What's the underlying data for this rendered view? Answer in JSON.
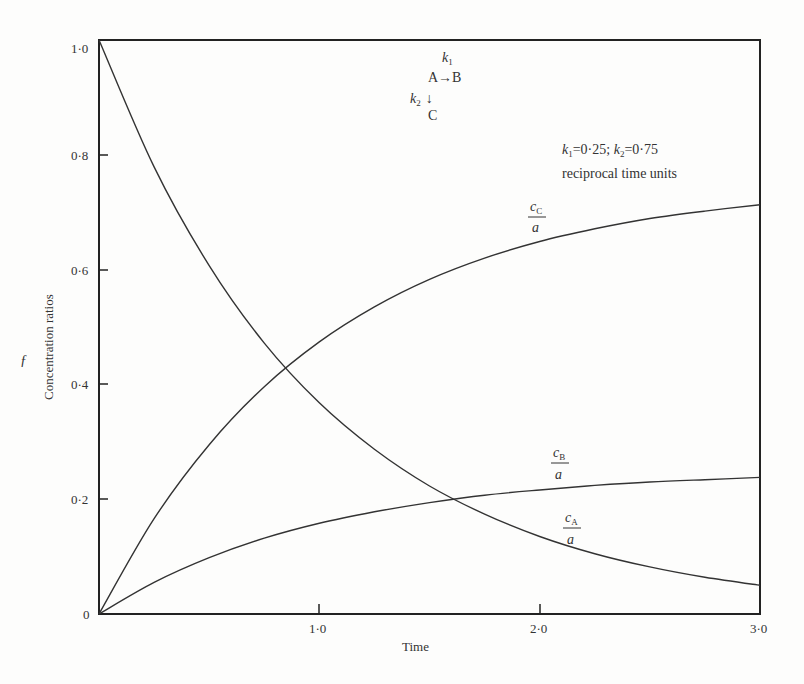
{
  "chart_data": {
    "type": "line",
    "title": "",
    "xlabel": "Time",
    "ylabel": "Concentration ratios",
    "xlim": [
      0,
      3.0
    ],
    "ylim": [
      0,
      1.0
    ],
    "x_ticks": [
      "1·0",
      "2·0",
      "3·0"
    ],
    "x_tick_values": [
      1.0,
      2.0,
      3.0
    ],
    "y_ticks": [
      "0",
      "0·2",
      "0·4",
      "0·6",
      "0·8",
      "1·0"
    ],
    "y_tick_values": [
      0,
      0.2,
      0.4,
      0.6,
      0.8,
      1.0
    ],
    "grid": false,
    "legend": "inline curve labels",
    "x": [
      0,
      0.25,
      0.5,
      0.75,
      1.0,
      1.25,
      1.5,
      1.75,
      2.0,
      2.25,
      2.5,
      2.75,
      3.0
    ],
    "series": [
      {
        "name": "cA/a",
        "label_num": "c",
        "label_sub": "A",
        "label_den": "a",
        "values": [
          1.0,
          0.779,
          0.607,
          0.472,
          0.368,
          0.287,
          0.223,
          0.174,
          0.135,
          0.105,
          0.082,
          0.064,
          0.05
        ]
      },
      {
        "name": "cB/a",
        "label_num": "c",
        "label_sub": "B",
        "label_den": "a",
        "values": [
          0.0,
          0.055,
          0.098,
          0.132,
          0.158,
          0.178,
          0.194,
          0.207,
          0.216,
          0.224,
          0.23,
          0.234,
          0.238
        ]
      },
      {
        "name": "cC/a",
        "label_num": "c",
        "label_sub": "C",
        "label_den": "a",
        "values": [
          0.0,
          0.166,
          0.295,
          0.396,
          0.474,
          0.535,
          0.583,
          0.62,
          0.649,
          0.671,
          0.689,
          0.702,
          0.713
        ]
      }
    ],
    "annotations": {
      "scheme": {
        "k1": "k",
        "k1_sub": "1",
        "reaction": "A→B",
        "k2": "k",
        "k2_sub": "2",
        "down_arrow": "↓",
        "product": "C"
      },
      "rates": {
        "text_k1": "k",
        "sub1": "1",
        "val1": "=0·25; ",
        "text_k2": "k",
        "sub2": "2",
        "val2": "=0·75"
      },
      "units": "reciprocal time units",
      "side_mark": "ƒ"
    }
  }
}
